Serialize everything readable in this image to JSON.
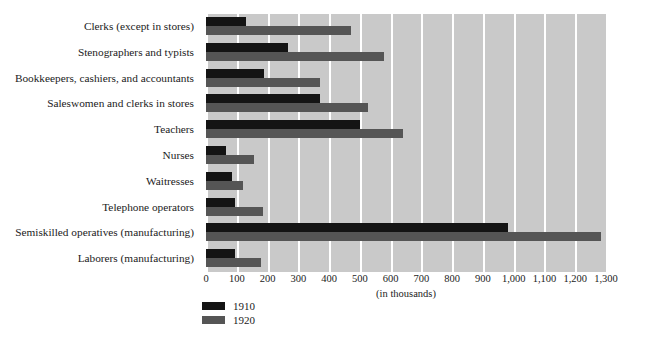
{
  "chart_data": {
    "type": "bar",
    "orientation": "horizontal",
    "title": "",
    "subtitle": "",
    "xlabel": "(in thousands)",
    "ylabel": "",
    "xlim": [
      0,
      1300
    ],
    "xticks": [
      0,
      100,
      200,
      300,
      400,
      500,
      600,
      700,
      800,
      900,
      1000,
      1100,
      1200,
      1300
    ],
    "xtick_labels": [
      "0",
      "100",
      "200",
      "300",
      "400",
      "500",
      "600",
      "700",
      "800",
      "900",
      "1,000",
      "1,100",
      "1,200",
      "1,300"
    ],
    "grid": true,
    "grid_axis": "x",
    "legend_position": "bottom-left",
    "categories": [
      "Clerks (except in stores)",
      "Stenographers and typists",
      "Bookkeepers, cashiers, and accountants",
      "Saleswomen and clerks in stores",
      "Teachers",
      "Nurses",
      "Waitresses",
      "Telephone operators",
      "Semiskilled operatives (manufacturing)",
      "Laborers (manufacturing)"
    ],
    "series": [
      {
        "name": "1910",
        "color": "#141414",
        "values": [
          130,
          265,
          190,
          370,
          500,
          65,
          85,
          95,
          980,
          95
        ]
      },
      {
        "name": "1920",
        "color": "#555555",
        "values": [
          470,
          580,
          370,
          525,
          640,
          155,
          120,
          185,
          1285,
          180
        ]
      }
    ]
  },
  "plot": {
    "background_color": "#c9c9c9",
    "gridline_color": "#ffffff"
  },
  "source_note": ""
}
